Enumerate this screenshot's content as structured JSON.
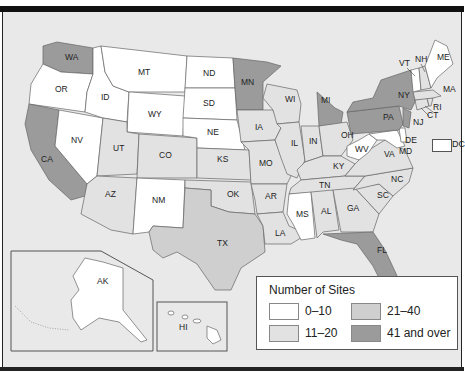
{
  "map": {
    "title": "Number of Sites by State",
    "colors": {
      "c0_10": "#ffffff",
      "c11_20": "#e2e2e2",
      "c21_40": "#cfcfcf",
      "c41_over": "#9b9b9b",
      "background": "#e9e9e9"
    },
    "states": {
      "WA": "41 and over",
      "OR": "0-10",
      "CA": "41 and over",
      "NV": "0-10",
      "ID": "0-10",
      "MT": "0-10",
      "WY": "0-10",
      "UT": "11-20",
      "CO": "11-20",
      "AZ": "11-20",
      "NM": "0-10",
      "ND": "0-10",
      "SD": "0-10",
      "NE": "0-10",
      "KS": "11-20",
      "OK": "11-20",
      "TX": "21-40",
      "MN": "41 and over",
      "IA": "11-20",
      "MO": "11-20",
      "AR": "11-20",
      "LA": "11-20",
      "WI": "11-20",
      "IL": "11-20",
      "MI": "41 and over",
      "IN": "11-20",
      "OH": "11-20",
      "KY": "11-20",
      "TN": "11-20",
      "MS": "0-10",
      "AL": "11-20",
      "GA": "11-20",
      "FL": "41 and over",
      "SC": "11-20",
      "NC": "11-20",
      "VA": "11-20",
      "WV": "0-10",
      "MD": "0-10",
      "DE": "0-10",
      "PA": "41 and over",
      "NY": "41 and over",
      "NJ": "41 and over",
      "CT": "11-20",
      "RI": "11-20",
      "MA": "11-20",
      "VT": "0-10",
      "NH": "11-20",
      "ME": "0-10",
      "AK": "0-10",
      "HI": "0-10",
      "DC": "0-10"
    },
    "labels": {
      "WA": "WA",
      "OR": "OR",
      "CA": "CA",
      "NV": "NV",
      "ID": "ID",
      "MT": "MT",
      "WY": "WY",
      "UT": "UT",
      "CO": "CO",
      "AZ": "AZ",
      "NM": "NM",
      "ND": "ND",
      "SD": "SD",
      "NE": "NE",
      "KS": "KS",
      "OK": "OK",
      "TX": "TX",
      "MN": "MN",
      "IA": "IA",
      "MO": "MO",
      "AR": "AR",
      "LA": "LA",
      "WI": "WI",
      "IL": "IL",
      "MI": "MI",
      "IN": "IN",
      "OH": "OH",
      "KY": "KY",
      "TN": "TN",
      "MS": "MS",
      "AL": "AL",
      "GA": "GA",
      "FL": "FL",
      "SC": "SC",
      "NC": "NC",
      "VA": "VA",
      "WV": "WV",
      "MD": "MD",
      "DE": "DE",
      "PA": "PA",
      "NY": "NY",
      "NJ": "NJ",
      "CT": "CT",
      "RI": "RI",
      "MA": "MA",
      "VT": "VT",
      "NH": "NH",
      "ME": "ME",
      "AK": "AK",
      "HI": "HI",
      "DC": "DC"
    }
  },
  "legend": {
    "title": "Number of Sites",
    "items": [
      {
        "label": "0–10",
        "color": "#ffffff"
      },
      {
        "label": "11–20",
        "color": "#e2e2e2"
      },
      {
        "label": "21–40",
        "color": "#cfcfcf"
      },
      {
        "label": "41 and over",
        "color": "#9b9b9b"
      }
    ]
  }
}
